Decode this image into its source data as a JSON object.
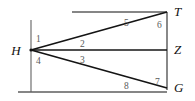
{
  "figure": {
    "type": "geometry-diagram",
    "colors": {
      "background": "#ffffff",
      "stroke": "#1a1a1a",
      "guide_stroke": "#6b6b6b",
      "point_label": "#111111",
      "angle_label": "#5a5a5a"
    },
    "points": [
      {
        "id": "H",
        "label": "H",
        "x": 31,
        "y": 50,
        "label_x": 16,
        "label_y": 55
      },
      {
        "id": "T",
        "label": "T",
        "x": 167,
        "y": 12,
        "label_x": 174,
        "label_y": 16
      },
      {
        "id": "Z",
        "label": "Z",
        "x": 167,
        "y": 50,
        "label_x": 174,
        "label_y": 54
      },
      {
        "id": "G",
        "label": "G",
        "x": 167,
        "y": 88,
        "label_x": 174,
        "label_y": 92
      }
    ],
    "segments": [
      {
        "id": "HT",
        "from": "H",
        "to": "T",
        "x1": 31,
        "y1": 50,
        "x2": 167,
        "y2": 12,
        "kind": "ray"
      },
      {
        "id": "HZ",
        "from": "H",
        "to": "Z",
        "x1": 31,
        "y1": 50,
        "x2": 167,
        "y2": 50,
        "kind": "ray"
      },
      {
        "id": "HG",
        "from": "H",
        "to": "G",
        "x1": 31,
        "y1": 50,
        "x2": 167,
        "y2": 88,
        "kind": "ray"
      },
      {
        "id": "TZG",
        "from": "T",
        "to": "G",
        "x1": 167,
        "y1": 12,
        "x2": 167,
        "y2": 88,
        "kind": "transversal"
      },
      {
        "id": "top-parallel",
        "from": "",
        "to": "T",
        "x1": 72,
        "y1": 12,
        "x2": 167,
        "y2": 12,
        "kind": "parallel-line"
      },
      {
        "id": "bottom-parallel",
        "from": "",
        "to": "G",
        "x1": 18,
        "y1": 92,
        "x2": 167,
        "y2": 92,
        "kind": "parallel-line"
      },
      {
        "id": "left-vertical",
        "from": "",
        "to": "",
        "x1": 31,
        "y1": 20,
        "x2": 31,
        "y2": 92,
        "kind": "guide"
      }
    ],
    "angle_labels": [
      {
        "id": "angle-1",
        "text": "1",
        "x": 36,
        "y": 41
      },
      {
        "id": "angle-2",
        "text": "2",
        "x": 80,
        "y": 46
      },
      {
        "id": "angle-3",
        "text": "3",
        "x": 80,
        "y": 62
      },
      {
        "id": "angle-4",
        "text": "4",
        "x": 36,
        "y": 65
      },
      {
        "id": "angle-5",
        "text": "5",
        "x": 128,
        "y": 25
      },
      {
        "id": "angle-6",
        "text": "6",
        "x": 157,
        "y": 27
      },
      {
        "id": "angle-7",
        "text": "7",
        "x": 157,
        "y": 84
      },
      {
        "id": "angle-8",
        "text": "8",
        "x": 128,
        "y": 88
      }
    ]
  }
}
